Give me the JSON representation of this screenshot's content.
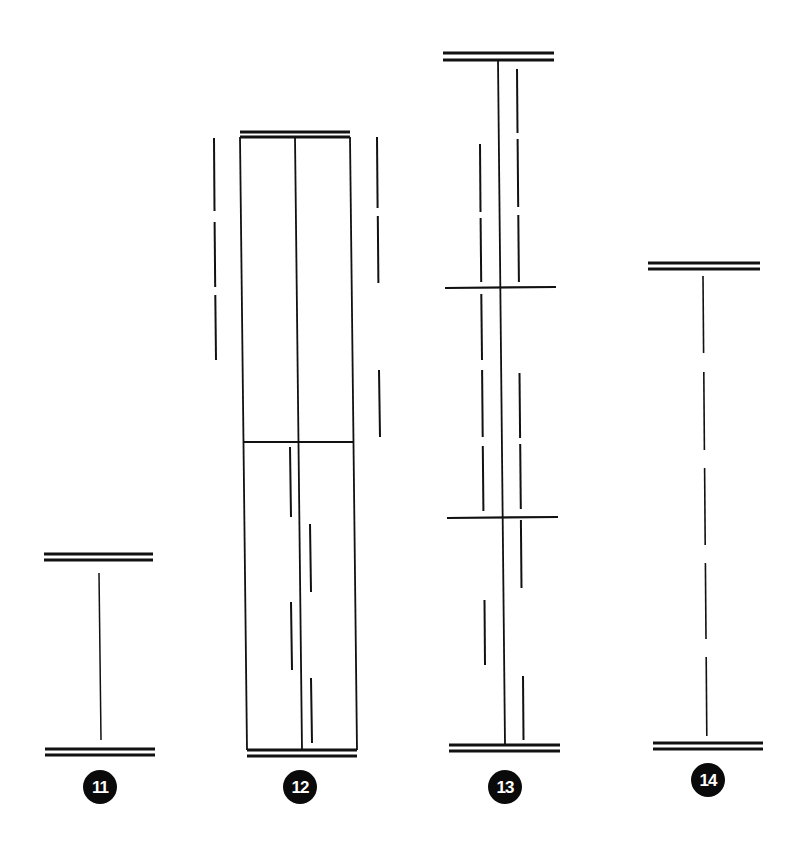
{
  "diagram": {
    "background": "#ffffff",
    "stroke_color": "#111111",
    "figures": [
      {
        "id": "fig-11",
        "label": "11",
        "badge": {
          "cx": 100,
          "cy": 787,
          "r": 17
        },
        "lines": [
          {
            "x1": 44,
            "y1": 554,
            "x2": 153,
            "y2": 554,
            "w": 3
          },
          {
            "x1": 44,
            "y1": 560,
            "x2": 153,
            "y2": 560,
            "w": 3
          },
          {
            "x1": 99,
            "y1": 573,
            "x2": 101,
            "y2": 740,
            "w": 1.5
          },
          {
            "x1": 45,
            "y1": 749,
            "x2": 155,
            "y2": 749,
            "w": 3
          },
          {
            "x1": 45,
            "y1": 755,
            "x2": 155,
            "y2": 755,
            "w": 3
          }
        ]
      },
      {
        "id": "fig-12",
        "label": "12",
        "badge": {
          "cx": 300,
          "cy": 787,
          "r": 17
        },
        "lines": [
          {
            "x1": 240,
            "y1": 132,
            "x2": 350,
            "y2": 132,
            "w": 3
          },
          {
            "x1": 240,
            "y1": 137,
            "x2": 350,
            "y2": 137,
            "w": 3
          },
          {
            "x1": 240,
            "y1": 137,
            "x2": 247,
            "y2": 750,
            "w": 1.8
          },
          {
            "x1": 350,
            "y1": 137,
            "x2": 357,
            "y2": 750,
            "w": 1.8
          },
          {
            "x1": 295,
            "y1": 137,
            "x2": 302,
            "y2": 750,
            "w": 1.8
          },
          {
            "x1": 243,
            "y1": 442,
            "x2": 353,
            "y2": 442,
            "w": 2.2
          },
          {
            "x1": 247,
            "y1": 750,
            "x2": 357,
            "y2": 750,
            "w": 3
          },
          {
            "x1": 247,
            "y1": 756,
            "x2": 357,
            "y2": 756,
            "w": 3
          },
          {
            "x1": 214,
            "y1": 138,
            "x2": 214.5,
            "y2": 211,
            "w": 2
          },
          {
            "x1": 214.6,
            "y1": 222,
            "x2": 215.2,
            "y2": 287,
            "w": 2
          },
          {
            "x1": 215.3,
            "y1": 295,
            "x2": 216,
            "y2": 360,
            "w": 2
          },
          {
            "x1": 377,
            "y1": 137,
            "x2": 377.6,
            "y2": 208,
            "w": 2
          },
          {
            "x1": 377.8,
            "y1": 216,
            "x2": 378.4,
            "y2": 283,
            "w": 2
          },
          {
            "x1": 379,
            "y1": 370,
            "x2": 380,
            "y2": 437,
            "w": 2
          },
          {
            "x1": 290,
            "y1": 447,
            "x2": 291,
            "y2": 517,
            "w": 2
          },
          {
            "x1": 310,
            "y1": 524,
            "x2": 311,
            "y2": 592,
            "w": 2
          },
          {
            "x1": 291,
            "y1": 602,
            "x2": 292,
            "y2": 670,
            "w": 2
          },
          {
            "x1": 311,
            "y1": 678,
            "x2": 312,
            "y2": 743,
            "w": 2
          }
        ]
      },
      {
        "id": "fig-13",
        "label": "13",
        "badge": {
          "cx": 505,
          "cy": 787,
          "r": 17
        },
        "lines": [
          {
            "x1": 443,
            "y1": 53,
            "x2": 554,
            "y2": 53,
            "w": 3
          },
          {
            "x1": 443,
            "y1": 60,
            "x2": 554,
            "y2": 60,
            "w": 3
          },
          {
            "x1": 498,
            "y1": 60,
            "x2": 505,
            "y2": 745,
            "w": 1.8
          },
          {
            "x1": 445,
            "y1": 288,
            "x2": 556,
            "y2": 287,
            "w": 2.2
          },
          {
            "x1": 447,
            "y1": 518,
            "x2": 558,
            "y2": 517,
            "w": 2.2
          },
          {
            "x1": 449,
            "y1": 745,
            "x2": 560,
            "y2": 745,
            "w": 3
          },
          {
            "x1": 449,
            "y1": 751,
            "x2": 560,
            "y2": 751,
            "w": 3
          },
          {
            "x1": 480,
            "y1": 144,
            "x2": 480.5,
            "y2": 212,
            "w": 2
          },
          {
            "x1": 480.6,
            "y1": 218,
            "x2": 481.2,
            "y2": 282,
            "w": 2
          },
          {
            "x1": 481.3,
            "y1": 294,
            "x2": 482,
            "y2": 360,
            "w": 2
          },
          {
            "x1": 482.1,
            "y1": 370,
            "x2": 482.7,
            "y2": 437,
            "w": 2
          },
          {
            "x1": 482.8,
            "y1": 446,
            "x2": 483.4,
            "y2": 511,
            "w": 2
          },
          {
            "x1": 484.5,
            "y1": 600,
            "x2": 485,
            "y2": 665,
            "w": 2
          },
          {
            "x1": 517,
            "y1": 69,
            "x2": 517.5,
            "y2": 133,
            "w": 2
          },
          {
            "x1": 517.6,
            "y1": 139,
            "x2": 518.2,
            "y2": 207,
            "w": 2
          },
          {
            "x1": 518.3,
            "y1": 215,
            "x2": 518.9,
            "y2": 282,
            "w": 2
          },
          {
            "x1": 519.5,
            "y1": 373,
            "x2": 520.1,
            "y2": 438,
            "w": 2
          },
          {
            "x1": 520.2,
            "y1": 444,
            "x2": 520.8,
            "y2": 509,
            "w": 2
          },
          {
            "x1": 520.9,
            "y1": 520,
            "x2": 521.5,
            "y2": 588,
            "w": 2
          },
          {
            "x1": 523,
            "y1": 676,
            "x2": 523.5,
            "y2": 740,
            "w": 2
          }
        ]
      },
      {
        "id": "fig-14",
        "label": "14",
        "badge": {
          "cx": 708,
          "cy": 780,
          "r": 17
        },
        "lines": [
          {
            "x1": 648,
            "y1": 263,
            "x2": 760,
            "y2": 263,
            "w": 3
          },
          {
            "x1": 648,
            "y1": 269,
            "x2": 760,
            "y2": 269,
            "w": 3
          },
          {
            "x1": 703,
            "y1": 276,
            "x2": 703.6,
            "y2": 353,
            "w": 1.6
          },
          {
            "x1": 703.8,
            "y1": 372,
            "x2": 704.4,
            "y2": 450,
            "w": 1.6
          },
          {
            "x1": 704.6,
            "y1": 468,
            "x2": 705.2,
            "y2": 545,
            "w": 1.6
          },
          {
            "x1": 705.4,
            "y1": 563,
            "x2": 706,
            "y2": 639,
            "w": 1.6
          },
          {
            "x1": 706.2,
            "y1": 657,
            "x2": 706.8,
            "y2": 736,
            "w": 1.6
          },
          {
            "x1": 653,
            "y1": 743,
            "x2": 763,
            "y2": 743,
            "w": 3
          },
          {
            "x1": 653,
            "y1": 749,
            "x2": 763,
            "y2": 749,
            "w": 3
          }
        ]
      }
    ]
  }
}
